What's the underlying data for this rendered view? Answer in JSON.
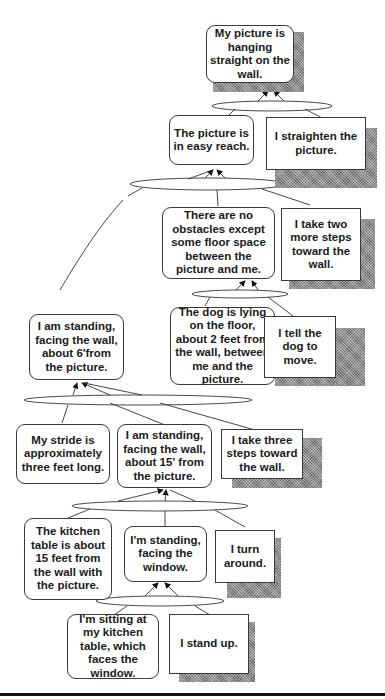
{
  "diagram": {
    "type": "goal-state means-ends tree",
    "nodes": [
      {
        "id": "goal",
        "kind": "state",
        "text": "My picture is hanging straight on the wall."
      },
      {
        "id": "easy-reach",
        "kind": "state",
        "text": "The picture is in easy reach."
      },
      {
        "id": "straighten",
        "kind": "action",
        "text": "I straighten the picture."
      },
      {
        "id": "no-obstacles",
        "kind": "state",
        "text": "There are no obstacles except some floor space between the picture and me."
      },
      {
        "id": "two-steps",
        "kind": "action",
        "text": "I take two more steps toward the wall."
      },
      {
        "id": "dog-lying",
        "kind": "state",
        "text": "The dog is lying on the floor, about 2 feet from the wall, between me and the picture."
      },
      {
        "id": "tell-dog",
        "kind": "action",
        "text": "I tell the dog to move."
      },
      {
        "id": "standing-6ft",
        "kind": "state",
        "text": "I am standing, facing the wall, about 6′from the picture."
      },
      {
        "id": "stride",
        "kind": "state",
        "text": "My stride is approximately three feet long."
      },
      {
        "id": "standing-15ft",
        "kind": "state",
        "text": "I am standing, facing the wall, about 15' from the picture."
      },
      {
        "id": "three-steps",
        "kind": "action",
        "text": "I take three steps toward the wall."
      },
      {
        "id": "kitchen-table",
        "kind": "state",
        "text": "The kitchen table is about 15 feet from the wall with the picture."
      },
      {
        "id": "facing-window",
        "kind": "state",
        "text": "I'm standing, facing the window."
      },
      {
        "id": "turn-around",
        "kind": "action",
        "text": "I turn around."
      },
      {
        "id": "sitting",
        "kind": "state",
        "text": "I'm sitting at my kitchen table, which faces the window."
      },
      {
        "id": "stand-up",
        "kind": "action",
        "text": "I stand up."
      }
    ],
    "edges": [
      {
        "from": [
          "easy-reach",
          "straighten"
        ],
        "to": "goal"
      },
      {
        "from": [
          "no-obstacles",
          "two-steps",
          "standing-6ft"
        ],
        "to": "easy-reach"
      },
      {
        "from": [
          "dog-lying",
          "tell-dog"
        ],
        "to": "no-obstacles"
      },
      {
        "from": [
          "stride",
          "standing-15ft",
          "three-steps"
        ],
        "to": "standing-6ft"
      },
      {
        "from": [
          "kitchen-table",
          "facing-window",
          "turn-around"
        ],
        "to": "standing-15ft"
      },
      {
        "from": [
          "sitting",
          "stand-up"
        ],
        "to": "facing-window"
      }
    ]
  }
}
